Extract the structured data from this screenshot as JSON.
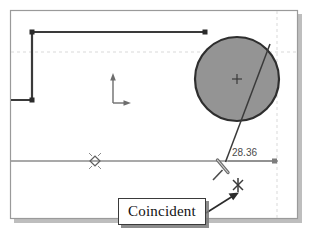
{
  "app": {
    "title": "CAD Sketch Viewport",
    "background_color": "#ffffff"
  },
  "viewport": {
    "frame": {
      "name": "sketch-frame",
      "x": 10,
      "y": 10,
      "width": 288,
      "height": 209,
      "border_color": "#9a9a9a",
      "shadow_color": "#a8a8a8"
    },
    "grid": {
      "visible": true,
      "color": "#d9d9d9",
      "style": "dashed",
      "horizontal_lines": [
        52
      ],
      "vertical_lines": [
        277
      ]
    }
  },
  "geometry": {
    "polyline": {
      "name": "sketch-polyline",
      "color": "#3a3a3a",
      "stroke_width": 2,
      "points": [
        {
          "x": 32,
          "y": 32
        },
        {
          "x": 205,
          "y": 32
        },
        {
          "x": 32,
          "y": 100
        },
        {
          "x": 10,
          "y": 100
        }
      ],
      "vertex_handles": [
        {
          "x": 32,
          "y": 32
        },
        {
          "x": 205,
          "y": 32
        },
        {
          "x": 32,
          "y": 100
        }
      ],
      "handle_color": "#2b2b2b"
    },
    "circle": {
      "name": "sketch-circle",
      "center_x": 237,
      "center_y": 79,
      "radius": 42,
      "fill_color": "#949494",
      "stroke_color": "#2e2e2e",
      "stroke_width": 2,
      "center_mark": "plus"
    },
    "horizontal_axis_line": {
      "name": "horizontal-construction-line",
      "x1": 12,
      "y1": 161,
      "x2": 277,
      "y2": 161,
      "color": "#8d8d8d",
      "stroke_width": 1.4
    },
    "diagonal_line": {
      "name": "sketch-diagonal-line",
      "x1": 268,
      "y1": 45,
      "x2": 226,
      "y2": 163,
      "color": "#3a3a3a",
      "stroke_width": 1.4
    },
    "dimension_line": {
      "name": "dimension-line",
      "x1": 228,
      "y1": 161,
      "x2": 275,
      "y2": 161,
      "color": "#7d7d7d",
      "endpoint_handle": {
        "x": 275,
        "y": 161
      }
    },
    "origin_axes": {
      "name": "origin-axes-indicator",
      "origin_x": 113,
      "origin_y": 103,
      "x_arrow_length": 14,
      "y_arrow_length": 27,
      "color": "#6d6d6d"
    },
    "point_marker": {
      "name": "snap-point-marker",
      "x": 95,
      "y": 161,
      "color": "#6a6a6a"
    }
  },
  "annotations": {
    "dimension": {
      "name": "dimension-value",
      "value": "28.36",
      "color": "#4a4a4a"
    },
    "tooltip": {
      "name": "coincident-tooltip",
      "label": "Coincident",
      "border_color": "#3a3a3a",
      "background_color": "#ffffff"
    },
    "leader_arrow": {
      "name": "tooltip-leader-arrow",
      "from_x": 208,
      "from_y": 212,
      "to_x": 235,
      "to_y": 194,
      "color": "#2b2b2b"
    },
    "coincident_glyph": {
      "name": "coincident-constraint-icon",
      "x": 238,
      "y": 185,
      "color": "#3a3a3a"
    },
    "cursor": {
      "name": "dimension-tool-cursor",
      "x": 222,
      "y": 166,
      "color": "#555555"
    }
  }
}
